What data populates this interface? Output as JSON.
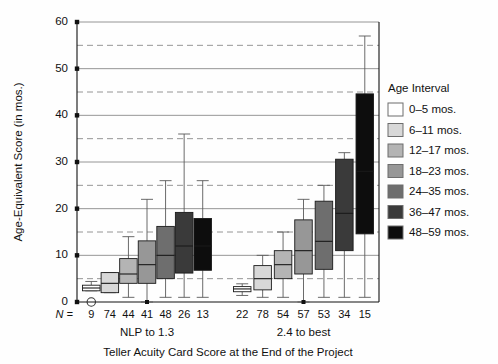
{
  "chart_data": {
    "type": "box",
    "title": "",
    "xlabel": "Teller Acuity Card Score at the End of the Project",
    "ylabel": "Age-Equivalent Score (in mos.)",
    "ylim": [
      0,
      60
    ],
    "yticks": [
      0,
      10,
      20,
      30,
      40,
      50,
      60
    ],
    "ytick_labels": [
      "0",
      "10",
      "20",
      "30",
      "40",
      "50",
      "60"
    ],
    "minor_gridlines": [
      5,
      15,
      25,
      35,
      45,
      55
    ],
    "grid": "solid at major ticks, dashed at minor ticks",
    "legend_position": "right",
    "legend_title": "Age Interval",
    "series": [
      {
        "name": "0–5 mos.",
        "color": "#ffffff"
      },
      {
        "name": "6–11 mos.",
        "color": "#d8d8d8"
      },
      {
        "name": "12–17 mos.",
        "color": "#b4b4b4"
      },
      {
        "name": "18–23 mos.",
        "color": "#979797"
      },
      {
        "name": "24–35 mos.",
        "color": "#6e6e6e"
      },
      {
        "name": "36–47 mos.",
        "color": "#3a3a3a"
      },
      {
        "name": "48–59 mos.",
        "color": "#0d0d0d"
      }
    ],
    "groups": [
      {
        "label": "NLP to 1.3",
        "n_values": [
          9,
          74,
          44,
          41,
          48,
          26,
          13
        ],
        "boxes": [
          {
            "series": "0–5 mos.",
            "whisker_low": 2.4,
            "q1": 2.4,
            "median": 3.0,
            "q3": 3.6,
            "whisker_high": 4.4
          },
          {
            "series": "6–11 mos.",
            "whisker_low": 2.0,
            "q1": 2.0,
            "median": 4.0,
            "q3": 6.3,
            "whisker_high": 6.3
          },
          {
            "series": "12–17 mos.",
            "whisker_low": 1.0,
            "q1": 4.0,
            "median": 6.0,
            "q3": 9.3,
            "whisker_high": 14.0
          },
          {
            "series": "18–23 mos.",
            "whisker_low": 0.0,
            "q1": 4.0,
            "median": 8.0,
            "q3": 13.1,
            "whisker_high": 22.0
          },
          {
            "series": "24–35 mos.",
            "whisker_low": 1.0,
            "q1": 5.0,
            "median": 10.0,
            "q3": 16.2,
            "whisker_high": 26.0
          },
          {
            "series": "36–47 mos.",
            "whisker_low": 1.0,
            "q1": 6.2,
            "median": 12.0,
            "q3": 19.2,
            "whisker_high": 36.0
          },
          {
            "series": "48–59 mos.",
            "whisker_low": 1.0,
            "q1": 6.8,
            "median": 12.0,
            "q3": 17.9,
            "whisker_high": 26.0
          }
        ]
      },
      {
        "label": "2.4 to best",
        "n_values": [
          22,
          78,
          54,
          57,
          53,
          34,
          15
        ],
        "boxes": [
          {
            "series": "0–5 mos.",
            "whisker_low": 1.4,
            "q1": 2.2,
            "median": 2.8,
            "q3": 3.3,
            "whisker_high": 3.9
          },
          {
            "series": "6–11 mos.",
            "whisker_low": 1.0,
            "q1": 2.6,
            "median": 5.0,
            "q3": 7.8,
            "whisker_high": 10.0
          },
          {
            "series": "12–17 mos.",
            "whisker_low": 1.0,
            "q1": 5.0,
            "median": 8.0,
            "q3": 11.0,
            "whisker_high": 15.0
          },
          {
            "series": "18–23 mos.",
            "whisker_low": 0.0,
            "q1": 6.0,
            "median": 11.0,
            "q3": 17.6,
            "whisker_high": 22.0
          },
          {
            "series": "24–35 mos.",
            "whisker_low": 1.0,
            "q1": 7.0,
            "median": 13.0,
            "q3": 21.6,
            "whisker_high": 25.0
          },
          {
            "series": "36–47 mos.",
            "whisker_low": 1.0,
            "q1": 11.0,
            "median": 19.0,
            "q3": 30.6,
            "whisker_high": 32.0
          },
          {
            "series": "48–59 mos.",
            "whisker_low": 1.0,
            "q1": 14.6,
            "median": 28.0,
            "q3": 44.6,
            "whisker_high": 57.0
          }
        ]
      }
    ],
    "outliers": [
      {
        "group": "NLP to 1.3",
        "series": "0–5 mos.",
        "value": 0,
        "marker": "open-circle"
      },
      {
        "group": "NLP to 1.3",
        "series": "18–23 mos.",
        "value": 0,
        "marker": "filled-square"
      },
      {
        "group": "2.4 to best",
        "series": "18–23 mos.",
        "value": 0,
        "marker": "filled-square"
      }
    ],
    "n_prefix": "N ="
  }
}
